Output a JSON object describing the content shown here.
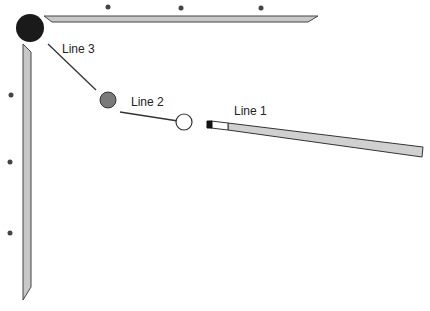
{
  "diagram": {
    "labels": {
      "line1": "Line 1",
      "line2": "Line 2",
      "line3": "Line 3"
    },
    "elements": {
      "pocket": "corner pocket (black)",
      "object_ball": "object ball (gray)",
      "cue_ball": "cue ball (white)",
      "cue_stick": "cue stick"
    },
    "colors": {
      "pocket": "#1a1a1a",
      "object_ball": "#7a7a7a",
      "cue_ball": "#ffffff",
      "rail": "#c8c8c8",
      "cue": "#d0d0d0",
      "outline": "#333333"
    },
    "diamonds": {
      "top": 3,
      "left": 3
    }
  }
}
